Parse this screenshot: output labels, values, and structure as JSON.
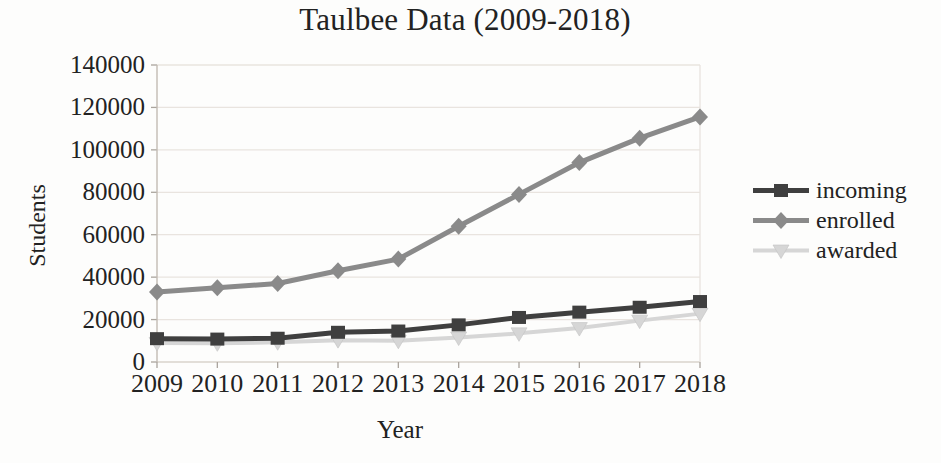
{
  "chart_data": {
    "type": "line",
    "title": "Taulbee Data (2009-2018)",
    "xlabel": "Year",
    "ylabel": "Students",
    "ylim": [
      0,
      140000
    ],
    "yticks": [
      0,
      20000,
      40000,
      60000,
      80000,
      100000,
      120000,
      140000
    ],
    "grid": true,
    "legend_position": "right",
    "categories": [
      "2009",
      "2010",
      "2011",
      "2012",
      "2013",
      "2014",
      "2015",
      "2016",
      "2017",
      "2018"
    ],
    "series": [
      {
        "name": "incoming",
        "marker": "square",
        "color": "#3f3f3f",
        "line_width": 5,
        "values": [
          11000,
          10800,
          11200,
          14000,
          14600,
          17500,
          21000,
          23500,
          25800,
          28500
        ]
      },
      {
        "name": "enrolled",
        "marker": "diamond",
        "color": "#8a8a8a",
        "line_width": 5,
        "values": [
          33000,
          35000,
          37000,
          43000,
          48500,
          64000,
          79000,
          94000,
          105500,
          115500
        ]
      },
      {
        "name": "awarded",
        "marker": "triangle-down",
        "color": "#d6d6d6",
        "line_width": 4,
        "values": [
          9000,
          8800,
          9300,
          10300,
          10000,
          11500,
          13500,
          16000,
          19500,
          22800
        ]
      }
    ]
  },
  "style": {
    "gridline_color": "#e9e4df",
    "axis_color": "#c2bbb4",
    "tick_color": "#aaa49d",
    "zero_line_color": "#d9d3cc",
    "text_color": "#222222"
  }
}
